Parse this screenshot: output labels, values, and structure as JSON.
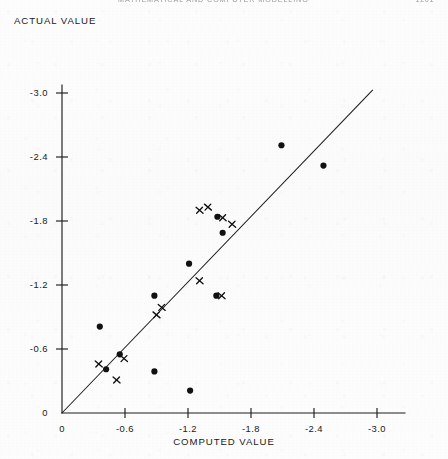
{
  "running_head": {
    "title": "MATHEMATICAL AND COMPUTER MODELLING",
    "folio": "1201"
  },
  "titles": {
    "y_axis": "ACTUAL VALUE",
    "x_axis": "COMPUTED VALUE"
  },
  "chart_data": {
    "type": "scatter",
    "title": "",
    "xlabel": "COMPUTED VALUE",
    "ylabel": "ACTUAL VALUE",
    "xlim": [
      0,
      -3.0
    ],
    "ylim": [
      0,
      -3.0
    ],
    "x_ticks": [
      "0",
      "-0.6",
      "-1.2",
      "-1.8",
      "-2.4",
      "-3.0"
    ],
    "y_ticks": [
      "0",
      "-0.6",
      "-1.2",
      "-1.8",
      "-2.4",
      "-3.0"
    ],
    "x_tick_values": [
      0,
      -0.6,
      -1.2,
      -1.8,
      -2.4,
      -3.0
    ],
    "y_tick_values": [
      0,
      -0.6,
      -1.2,
      -1.8,
      -2.4,
      -3.0
    ],
    "grid": false,
    "legend": "none",
    "reference_line": {
      "label": "y = x (1:1 identity line)",
      "from": [
        0,
        0
      ],
      "to": [
        -2.96,
        -3.03
      ]
    },
    "series": [
      {
        "name": "dot",
        "marker": "filled-circle",
        "color": "#111111",
        "points": [
          [
            -0.36,
            -0.81
          ],
          [
            -0.55,
            -0.55
          ],
          [
            -0.42,
            -0.41
          ],
          [
            -0.88,
            -0.39
          ],
          [
            -1.22,
            -0.21
          ],
          [
            -0.88,
            -1.1
          ],
          [
            -1.47,
            -1.1
          ],
          [
            -1.21,
            -1.4
          ],
          [
            -1.53,
            -1.69
          ],
          [
            -1.48,
            -1.84
          ],
          [
            -2.09,
            -2.51
          ],
          [
            -2.49,
            -2.32
          ]
        ]
      },
      {
        "name": "cross",
        "marker": "x",
        "color": "#111111",
        "points": [
          [
            -0.35,
            -0.46
          ],
          [
            -0.52,
            -0.31
          ],
          [
            -0.59,
            -0.51
          ],
          [
            -0.9,
            -0.92
          ],
          [
            -0.95,
            -0.99
          ],
          [
            -1.31,
            -1.24
          ],
          [
            -1.52,
            -1.1
          ],
          [
            -1.31,
            -1.9
          ],
          [
            -1.39,
            -1.93
          ],
          [
            -1.53,
            -1.83
          ],
          [
            -1.62,
            -1.77
          ]
        ]
      }
    ]
  }
}
